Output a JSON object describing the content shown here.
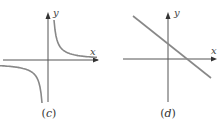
{
  "panels": [
    {
      "id": "c",
      "caption": "(c)",
      "caption_open": "(",
      "caption_letter": "c",
      "caption_close": ")",
      "x_axis_label": "x",
      "y_axis_label": "y",
      "graph_type": "hyperbola",
      "description": "Rectangular hyperbola y = k/x with branches in quadrants I and III",
      "colors": {
        "curve": "#888888",
        "axis": "#555555"
      }
    },
    {
      "id": "d",
      "caption": "(d)",
      "caption_open": "(",
      "caption_letter": "d",
      "caption_close": ")",
      "x_axis_label": "x",
      "y_axis_label": "y",
      "graph_type": "line",
      "description": "Straight line with negative slope, positive y-intercept and positive x-intercept",
      "colors": {
        "curve": "#888888",
        "axis": "#555555"
      }
    }
  ]
}
